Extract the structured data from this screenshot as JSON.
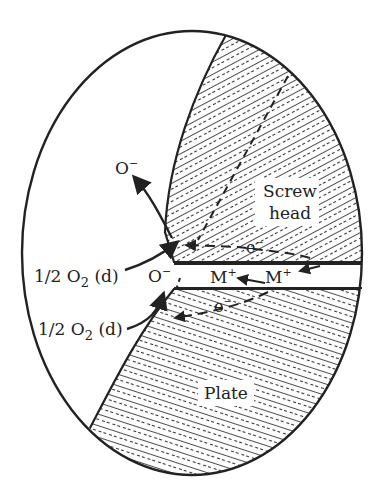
{
  "figure": {
    "type": "crevice-corrosion-diagram",
    "regions": {
      "screw_head": {
        "label_line1": "Screw",
        "label_line2": "head"
      },
      "plate": {
        "label": "Plate"
      }
    },
    "labels": {
      "o_minus_top": "O",
      "o_minus_top_sup": "−",
      "o_minus_mouth": "O",
      "o_minus_mouth_sup": "−",
      "o2_upper": "1/2 O",
      "o2_upper_sub": "2",
      "o2_upper_suffix": " (d)",
      "o2_lower": "1/2 O",
      "o2_lower_sub": "2",
      "o2_lower_suffix": " (d)",
      "electron_upper": "e",
      "electron_upper_sup": "−",
      "electron_lower": "e",
      "electron_lower_sup": "−",
      "metal_ion_left": "M",
      "metal_ion_left_sup": "+",
      "metal_ion_right": "M",
      "metal_ion_right_sup": "+"
    },
    "colors": {
      "ink": "#222222",
      "background": "#ffffff"
    }
  }
}
